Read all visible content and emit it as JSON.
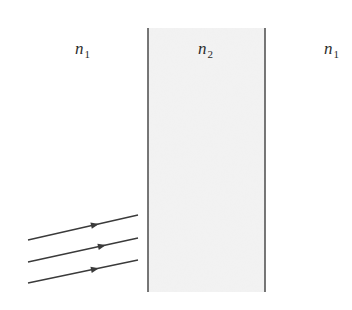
{
  "diagram": {
    "type": "optics-slab",
    "colors": {
      "background": "#ffffff",
      "slab_fill": "#f1f1f1",
      "slab_edge": "#555555",
      "ray": "#3a3a3a",
      "text": "#2b2b2b"
    },
    "regions": [
      {
        "id": "left-medium",
        "symbol": "n",
        "subscript": "1",
        "label_x": 75,
        "label_y": 40
      },
      {
        "id": "slab",
        "symbol": "n",
        "subscript": "2",
        "label_x": 198,
        "label_y": 40
      },
      {
        "id": "right-medium",
        "symbol": "n",
        "subscript": "1",
        "label_x": 324,
        "label_y": 40
      }
    ],
    "slab": {
      "x_left": 148,
      "x_right": 265,
      "y_top": 28,
      "y_bottom": 292
    },
    "rays": [
      {
        "x1": 28,
        "y1": 240,
        "x2": 138,
        "y2": 215,
        "arrow_x": 95,
        "arrow_y": 224.8
      },
      {
        "x1": 28,
        "y1": 262,
        "x2": 138,
        "y2": 238,
        "arrow_x": 102,
        "arrow_y": 245.9
      },
      {
        "x1": 28,
        "y1": 283,
        "x2": 138,
        "y2": 260,
        "arrow_x": 95,
        "arrow_y": 269.0
      }
    ]
  }
}
